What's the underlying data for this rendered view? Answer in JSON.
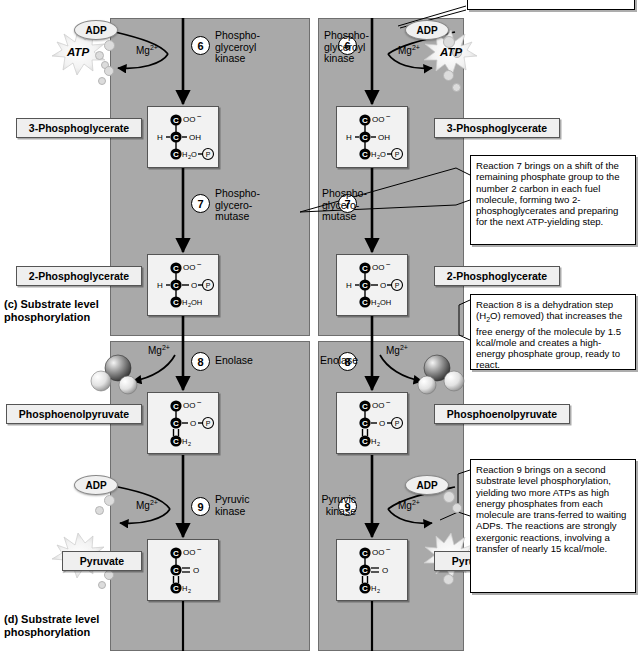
{
  "figure": {
    "panel_color": "#a9a9a9",
    "captions": [
      {
        "id": "c",
        "label": "(c)  Substrate level\n      phosphorylation"
      },
      {
        "id": "d",
        "label": "(d)  Substrate level\n      phosphorylation"
      }
    ]
  },
  "steps": [
    {
      "number": "6",
      "enzyme": "Phospho-\nglyceroyl\nkinase",
      "cofactor": "Mg",
      "cofactor_charge": "2+",
      "substrate_in": "ADP",
      "product_out": "ATP"
    },
    {
      "number": "7",
      "enzyme": "Phospho-\nglycero-\nmutase",
      "cofactor": null,
      "cofactor_charge": null,
      "substrate_in": null,
      "product_out": null
    },
    {
      "number": "8",
      "enzyme": "Enolase",
      "cofactor": "Mg",
      "cofactor_charge": "2+",
      "substrate_in": null,
      "product_out": "H2O"
    },
    {
      "number": "9",
      "enzyme": "Pyruvic\nkinase",
      "cofactor": "Mg",
      "cofactor_charge": "2+",
      "substrate_in": "ADP",
      "product_out": "ATP"
    }
  ],
  "compounds": [
    {
      "name": "3-Phosphoglycerate",
      "structure": {
        "line1": {
          "carbon": "C",
          "rest": "OO",
          "charge": "−"
        },
        "line2": {
          "left": "H",
          "carbon": "C",
          "right": "OH"
        },
        "line3": {
          "carbon": "C",
          "rest": "H₂O",
          "phosphate": "P"
        }
      }
    },
    {
      "name": "2-Phosphoglycerate",
      "structure": {
        "line1": {
          "carbon": "C",
          "rest": "OO",
          "charge": "−"
        },
        "line2": {
          "left": "H",
          "carbon": "C",
          "right": "O",
          "phosphate": "P"
        },
        "line3": {
          "carbon": "C",
          "rest": "H₂OH"
        }
      }
    },
    {
      "name": "Phosphoenolpyruvate",
      "structure": {
        "line1": {
          "carbon": "C",
          "rest": "OO",
          "charge": "−"
        },
        "line2": {
          "carbon": "C",
          "right": "O",
          "phosphate": "P"
        },
        "line3": {
          "carbon": "C",
          "rest": "H₂"
        }
      }
    },
    {
      "name": "Pyruvate",
      "structure": {
        "line1": {
          "carbon": "C",
          "rest": "OO",
          "charge": "−"
        },
        "line2": {
          "carbon": "C",
          "right": "O",
          "double_bond": true
        },
        "line3": {
          "carbon": "C",
          "rest": "H₂"
        }
      }
    }
  ],
  "notes": [
    {
      "id": "note-top",
      "text": "Reaction 6 makes"
    },
    {
      "id": "note-reaction-7",
      "text": "Reaction 7 brings on a shift of the remaining phosphate group to the number 2 carbon in each fuel molecule, forming two 2-phosphoglycerates and preparing  for the next ATP-yielding step."
    },
    {
      "id": "note-reaction-8",
      "text_parts": [
        "Reaction 8 is a dehydration step (H",
        "2",
        "O) removed) that increases the free energy of the molecule by 1.5 kcal/mole and creates a high-energy phosphate group, ready to react."
      ],
      "text": "Reaction 8 is a dehydration step (H2O) removed) that increases the free energy of the molecule by 1.5 kcal/mole and creates a high-energy phosphate group, ready to react."
    },
    {
      "id": "note-reaction-9",
      "text": "Reaction 9 brings on a second substrate level phosphorylation, yielding two more ATPs as high energy phosphates from each molecule are trans-ferred to waiting ADPs. The reactions are strongly exergonic reactions, involving a transfer of nearly 15 kcal/mole."
    }
  ],
  "labels": {
    "adp": "ADP",
    "atp": "ATP",
    "phosphate": "P",
    "mg": "Mg",
    "mg_charge": "2+"
  }
}
